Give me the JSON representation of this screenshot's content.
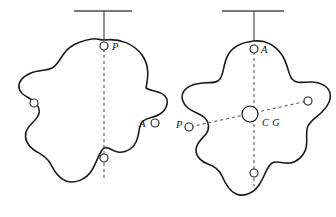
{
  "figure": {
    "background_color": "#ffffff",
    "outline_color": "#1b1b1b",
    "dash_color": "#5a5a5a",
    "support_color": "#4a4a4a",
    "cg_fill_color": "#000000",
    "width": 336,
    "height": 217
  },
  "left_figure": {
    "name": "lamina-suspended-from-p",
    "support": {
      "bar_label": "support-bar",
      "rod_label": "support-rod"
    },
    "pivot_label": "P",
    "hole_label": "A",
    "holes": [
      {
        "id": "pivot-p",
        "label": "P",
        "label_side": "right"
      },
      {
        "id": "hole-a",
        "label": "A",
        "label_side": "left"
      },
      {
        "id": "hole-left",
        "label": "",
        "label_side": "none"
      },
      {
        "id": "hole-bottom",
        "label": "",
        "label_side": "none"
      }
    ],
    "plumb_line": "vertical-dashed-through-p"
  },
  "right_figure": {
    "name": "lamina-suspended-from-a",
    "support": {
      "bar_label": "support-bar",
      "rod_label": "support-rod"
    },
    "pivot_label": "A",
    "second_label": "P",
    "cg_label": "C G",
    "holes": [
      {
        "id": "pivot-a",
        "label": "A",
        "label_side": "right"
      },
      {
        "id": "hole-p",
        "label": "P",
        "label_side": "left"
      },
      {
        "id": "hole-right",
        "label": "",
        "label_side": "none"
      },
      {
        "id": "hole-bottom",
        "label": "",
        "label_side": "none"
      }
    ],
    "plumb_lines": [
      "vertical-dashed-through-a",
      "diagonal-dashed-through-p"
    ],
    "cg_marker": "quartered-circle"
  }
}
